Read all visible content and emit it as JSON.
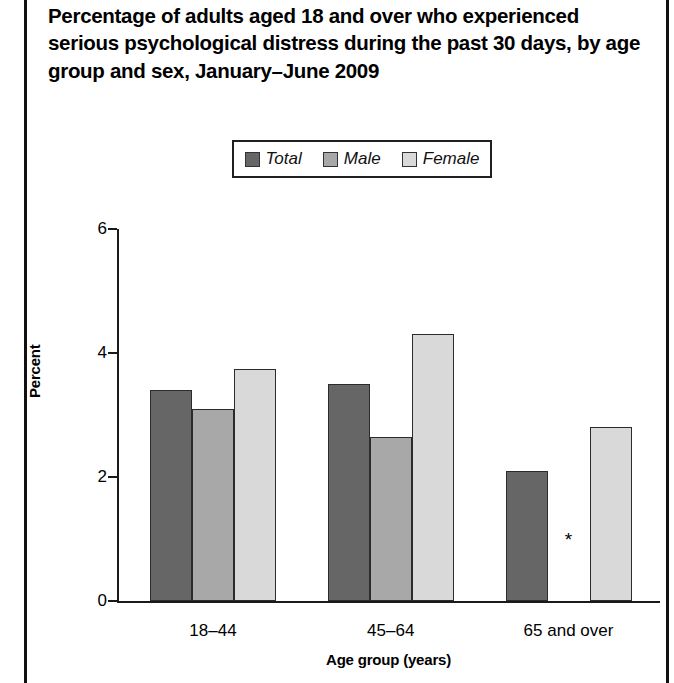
{
  "figure": {
    "title": "Percentage of adults aged 18 and over who experienced serious psychological distress during the past 30 days, by age group and sex, January–June 2009"
  },
  "legend": {
    "items": [
      {
        "label": "Total",
        "color": "#666666"
      },
      {
        "label": "Male",
        "color": "#a8a8a8"
      },
      {
        "label": "Female",
        "color": "#d9d9d9"
      }
    ]
  },
  "axes": {
    "y_title": "Percent",
    "x_title": "Age group (years)",
    "y_ticks": [
      "0",
      "2",
      "4",
      "6"
    ]
  },
  "annotations": {
    "suppressed_marker": "*"
  },
  "chart_data": {
    "type": "bar",
    "title": "Percentage of adults aged 18 and over who experienced serious psychological distress during the past 30 days, by age group and sex, January–June 2009",
    "xlabel": "Age group (years)",
    "ylabel": "Percent",
    "ylim": [
      0,
      6
    ],
    "yticks": [
      0,
      2,
      4,
      6
    ],
    "grid": false,
    "legend_position": "top-center",
    "categories": [
      "18–44",
      "45–64",
      "65 and over"
    ],
    "series": [
      {
        "name": "Total",
        "color": "#666666",
        "values": [
          3.4,
          3.5,
          2.1
        ]
      },
      {
        "name": "Male",
        "color": "#a8a8a8",
        "values": [
          3.1,
          2.65,
          null
        ]
      },
      {
        "name": "Female",
        "color": "#d9d9d9",
        "values": [
          3.75,
          4.3,
          2.8
        ]
      }
    ]
  }
}
